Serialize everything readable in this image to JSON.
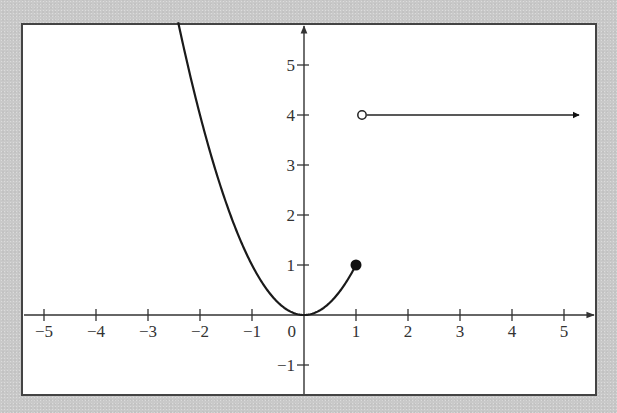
{
  "chart_data": {
    "type": "line",
    "title": "",
    "xlabel": "",
    "ylabel": "",
    "xlim": [
      -5.4,
      5.6
    ],
    "ylim": [
      -1.6,
      5.8
    ],
    "grid": false,
    "x_ticks": [
      -5,
      -4,
      -3,
      -2,
      -1,
      1,
      2,
      3,
      4,
      5
    ],
    "x_tick_labels": [
      "−5",
      "−4",
      "−3",
      "−2",
      "−1",
      "1",
      "2",
      "3",
      "4",
      "5"
    ],
    "y_ticks": [
      -1,
      1,
      2,
      3,
      4,
      5
    ],
    "y_tick_labels": [
      "−1",
      "1",
      "2",
      "3",
      "4",
      "5"
    ],
    "origin_label": "0",
    "series": [
      {
        "name": "piece-1",
        "description": "y = x^2 for x <= 1",
        "x": [
          -2.4,
          -2,
          -1.5,
          -1,
          -0.5,
          0,
          0.5,
          1
        ],
        "y": [
          5.76,
          4,
          2.25,
          1,
          0.25,
          0,
          0.25,
          1
        ],
        "end_point": {
          "x": 1,
          "y": 1,
          "style": "closed"
        }
      },
      {
        "name": "piece-2",
        "description": "y = 4 for x > 1",
        "x": [
          1,
          5.3
        ],
        "y": [
          4,
          4
        ],
        "start_point": {
          "x": 1,
          "y": 4,
          "style": "open"
        },
        "end_arrow": true
      }
    ],
    "colors": {
      "curve": "#1a1a1a",
      "axes": "#333333",
      "frame": "#444444",
      "plot_bg": "#ffffff",
      "page_bg": "#c9c9c9"
    }
  }
}
